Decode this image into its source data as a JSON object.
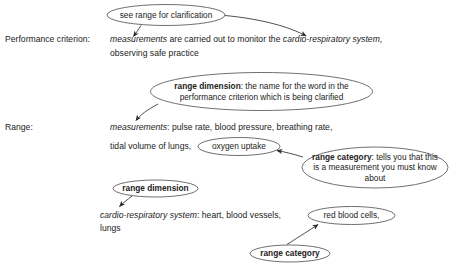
{
  "diagram": {
    "rows": [
      {
        "id": "performance-criterion",
        "label": "Performance criterion:",
        "lines": [
          {
            "segments": [
              {
                "text": "measurements",
                "style": "italic"
              },
              {
                "text": " are carried out to monitor the ",
                "style": "normal"
              },
              {
                "text": "cardio-respiratory system",
                "style": "italic"
              },
              {
                "text": ",",
                "style": "normal"
              }
            ]
          },
          {
            "segments": [
              {
                "text": "observing safe practice",
                "style": "normal"
              }
            ]
          }
        ]
      },
      {
        "id": "range",
        "label": "Range:",
        "lines": [
          {
            "segments": [
              {
                "text": "measurements",
                "style": "italic"
              },
              {
                "text": ": pulse rate, blood pressure, breathing rate,",
                "style": "normal"
              }
            ]
          },
          {
            "segments": [
              {
                "text": "tidal volume of lungs,",
                "style": "normal"
              }
            ]
          },
          {
            "segments": [
              {
                "text": "cardio-respiratory system",
                "style": "italic"
              },
              {
                "text": ": heart, blood vessels,",
                "style": "normal"
              }
            ]
          },
          {
            "segments": [
              {
                "text": "lungs",
                "style": "normal"
              }
            ]
          }
        ]
      }
    ],
    "callouts": [
      {
        "id": "see-range-for-clarification",
        "text": "see range for clarification",
        "bold_lead": "",
        "kind": "annotation"
      },
      {
        "id": "range-dimension-top",
        "bold_lead": "range dimension",
        "text": ": the name for the word in the performance criterion which is being clarified",
        "kind": "definition"
      },
      {
        "id": "range-category-right",
        "bold_lead": "range category",
        "text": ": tells you that this is a measurement you must know about",
        "kind": "definition"
      },
      {
        "id": "range-dimension-lower",
        "bold_lead": "range dimension",
        "text": "",
        "kind": "tag"
      },
      {
        "id": "range-category-bottom",
        "bold_lead": "range category",
        "text": "",
        "kind": "tag"
      }
    ],
    "circled_terms": [
      {
        "id": "oxygen-uptake",
        "text": "oxygen uptake"
      },
      {
        "id": "red-blood-cells",
        "text": "red blood cells,"
      }
    ],
    "colors": {
      "background": "#ffffff",
      "text": "#222222",
      "ellipse_stroke": "#55555a",
      "connector_stroke": "#3a3a3f"
    }
  }
}
